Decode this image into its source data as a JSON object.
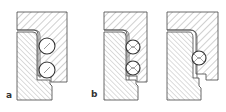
{
  "figure": {
    "type": "mechanical cross-section",
    "panels": [
      {
        "id": "a",
        "label": "a",
        "balls": 2
      },
      {
        "id": "b",
        "label": "b",
        "balls": 2
      },
      {
        "id": "c",
        "label": "",
        "balls": 1
      }
    ]
  },
  "colors": {
    "line": "#444444",
    "hatch": "#777777",
    "background": "#ffffff"
  }
}
